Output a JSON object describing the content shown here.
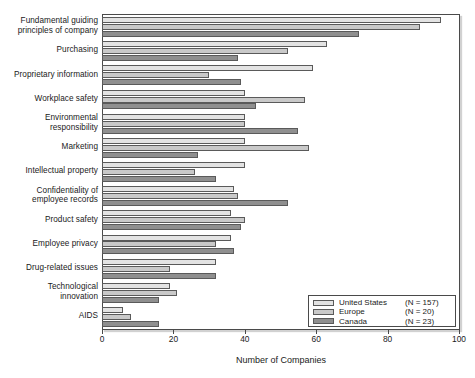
{
  "chart_data": {
    "type": "bar",
    "orientation": "horizontal",
    "title": "",
    "xlabel": "Number of Companies",
    "ylabel": "",
    "xlim": [
      0,
      100
    ],
    "xticks": [
      0,
      20,
      40,
      60,
      80,
      100
    ],
    "grid": false,
    "legend_position": "bottom-right",
    "categories": [
      "Fundamental guiding principles of company",
      "Purchasing",
      "Proprietary information",
      "Workplace safety",
      "Environmental responsibility",
      "Marketing",
      "Intellectual property",
      "Confidentiality of employee records",
      "Product safety",
      "Employee privacy",
      "Drug-related issues",
      "Technological innovation",
      "AIDS"
    ],
    "series": [
      {
        "name": "United States",
        "n_label": "(N = 157)",
        "color": "#e3e3e3",
        "values": [
          95,
          63,
          59,
          40,
          40,
          40,
          40,
          37,
          36,
          36,
          32,
          19,
          6
        ]
      },
      {
        "name": "Europe",
        "n_label": "(N = 20)",
        "color": "#c9c9c9",
        "values": [
          89,
          52,
          30,
          57,
          40,
          58,
          26,
          38,
          40,
          32,
          19,
          21,
          8
        ]
      },
      {
        "name": "Canada",
        "n_label": "(N = 23)",
        "color": "#8f8f8f",
        "values": [
          72,
          38,
          39,
          43,
          55,
          27,
          32,
          52,
          39,
          37,
          32,
          16,
          16
        ]
      }
    ]
  },
  "labels": {
    "categories_lines": [
      [
        "Fundamental guiding",
        "principles of company"
      ],
      [
        "Purchasing"
      ],
      [
        "Proprietary information"
      ],
      [
        "Workplace safety"
      ],
      [
        "Environmental",
        "responsibility"
      ],
      [
        "Marketing"
      ],
      [
        "Intellectual property"
      ],
      [
        "Confidentiality of",
        "employee records"
      ],
      [
        "Product safety"
      ],
      [
        "Employee privacy"
      ],
      [
        "Drug-related issues"
      ],
      [
        "Technological",
        "innovation"
      ],
      [
        "AIDS"
      ]
    ]
  }
}
